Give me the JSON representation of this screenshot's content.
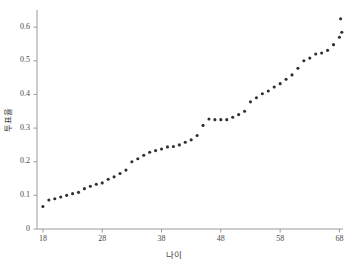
{
  "chart_data": {
    "type": "scatter",
    "title": "",
    "xlabel": "나이",
    "ylabel": "투표율",
    "xlim": [
      17,
      68.6
    ],
    "ylim": [
      0,
      0.645
    ],
    "grid": false,
    "legend": "none",
    "marker": {
      "shape": "circle",
      "color": "#2f2f2f",
      "size_px": 3.1
    },
    "xticks": [
      18,
      28,
      38,
      48,
      58,
      68
    ],
    "xtick_labels": [
      "18",
      "28",
      "38",
      "48",
      "58",
      "68"
    ],
    "yticks": [
      0,
      0.1,
      0.2,
      0.3,
      0.4,
      0.5,
      0.6
    ],
    "ytick_labels": [
      "0",
      "0.1",
      "0.2",
      "0.3",
      "0.4",
      "0.5",
      "0.6"
    ],
    "x": [
      18,
      19,
      20,
      21,
      22,
      23,
      24,
      25,
      26,
      27,
      28,
      29,
      30,
      31,
      32,
      33,
      34,
      35,
      36,
      37,
      38,
      39,
      40,
      41,
      42,
      43,
      44,
      45,
      46,
      47,
      48,
      49,
      50,
      51,
      52,
      53,
      54,
      55,
      56,
      57,
      58,
      59,
      60,
      61,
      62,
      63,
      64,
      65,
      66,
      67,
      68
    ],
    "y": [
      0.067,
      0.086,
      0.09,
      0.095,
      0.1,
      0.105,
      0.109,
      0.12,
      0.127,
      0.133,
      0.137,
      0.148,
      0.155,
      0.165,
      0.175,
      0.2,
      0.209,
      0.219,
      0.228,
      0.233,
      0.238,
      0.244,
      0.245,
      0.25,
      0.258,
      0.265,
      0.278,
      0.308,
      0.327,
      0.325,
      0.325,
      0.325,
      0.332,
      0.34,
      0.35,
      0.378,
      0.39,
      0.402,
      0.41,
      0.422,
      0.432,
      0.445,
      0.458,
      0.478,
      0.5,
      0.508,
      0.52,
      0.523,
      0.531,
      0.548,
      0.57,
      0.625,
      0.585
    ],
    "series": [
      {
        "name": "투표율",
        "points": [
          [
            18,
            0.067
          ],
          [
            19,
            0.086
          ],
          [
            20,
            0.09
          ],
          [
            21,
            0.095
          ],
          [
            22,
            0.1
          ],
          [
            23,
            0.105
          ],
          [
            24,
            0.109
          ],
          [
            25,
            0.12
          ],
          [
            26,
            0.127
          ],
          [
            27,
            0.133
          ],
          [
            28,
            0.137
          ],
          [
            29,
            0.148
          ],
          [
            30,
            0.155
          ],
          [
            31,
            0.165
          ],
          [
            32,
            0.175
          ],
          [
            33,
            0.2
          ],
          [
            34,
            0.209
          ],
          [
            35,
            0.219
          ],
          [
            36,
            0.228
          ],
          [
            37,
            0.233
          ],
          [
            38,
            0.238
          ],
          [
            39,
            0.244
          ],
          [
            40,
            0.245
          ],
          [
            41,
            0.25
          ],
          [
            42,
            0.258
          ],
          [
            43,
            0.265
          ],
          [
            44,
            0.278
          ],
          [
            45,
            0.308
          ],
          [
            46,
            0.327
          ],
          [
            47,
            0.325
          ],
          [
            48,
            0.325
          ],
          [
            49,
            0.325
          ],
          [
            50,
            0.332
          ],
          [
            51,
            0.34
          ],
          [
            52,
            0.35
          ],
          [
            53,
            0.378
          ],
          [
            54,
            0.39
          ],
          [
            55,
            0.402
          ],
          [
            56,
            0.41
          ],
          [
            57,
            0.422
          ],
          [
            58,
            0.432
          ],
          [
            59,
            0.445
          ],
          [
            60,
            0.458
          ],
          [
            61,
            0.478
          ],
          [
            62,
            0.5
          ],
          [
            63,
            0.508
          ],
          [
            64,
            0.52
          ],
          [
            65,
            0.523
          ],
          [
            66,
            0.531
          ],
          [
            67,
            0.548
          ],
          [
            68,
            0.57
          ],
          [
            68.2,
            0.625
          ],
          [
            68.4,
            0.585
          ]
        ]
      }
    ]
  },
  "axes": {
    "axis_color": "#9a9a9a",
    "x_label": "나이",
    "y_label": "투표율"
  }
}
